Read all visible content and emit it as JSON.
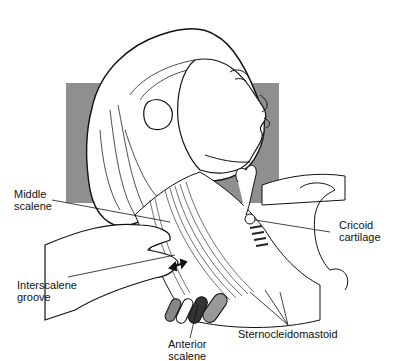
{
  "figure": {
    "background_panel_color": "#8f8f8f",
    "line_color": "#111111"
  },
  "labels": {
    "middle_scalene": [
      "Middle",
      "scalene"
    ],
    "interscalene_groove": [
      "Interscalene",
      "groove"
    ],
    "cricoid_cartilage": [
      "Cricoid",
      "cartilage"
    ],
    "anterior_scalene": [
      "Anterior",
      "scalene"
    ],
    "sternocleidomastoid": "Sternocleidomastoid"
  }
}
